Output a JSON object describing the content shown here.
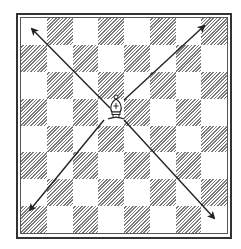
{
  "diagram": {
    "type": "chessboard",
    "rows": 8,
    "cols": 8,
    "top_left_square": "light",
    "colors": {
      "dark_hatch": "#7a7a7a",
      "light": "#ffffff",
      "border": "#333333",
      "arrow": "#222222"
    },
    "piece": {
      "name": "bishop",
      "color": "white",
      "icon": "bishop-icon",
      "row": 4,
      "col": 3
    },
    "arrows": [
      {
        "name": "arrow-up-left",
        "from": [
          110,
          108
        ],
        "to": [
          32,
          29
        ]
      },
      {
        "name": "arrow-up-right",
        "from": [
          124,
          100
        ],
        "to": [
          204,
          26
        ]
      },
      {
        "name": "arrow-down-left",
        "from": [
          104,
          120
        ],
        "to": [
          30,
          210
        ]
      },
      {
        "name": "arrow-down-right",
        "from": [
          124,
          120
        ],
        "to": [
          214,
          218
        ]
      }
    ]
  }
}
